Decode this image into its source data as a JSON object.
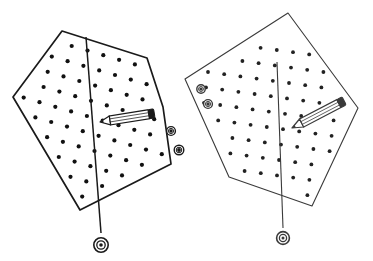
{
  "canvas": {
    "width": 373,
    "height": 261,
    "background": "#ffffff",
    "title": "Two dotted pentagonal panels with pencils and plumb lines"
  },
  "palette": {
    "ink": "#1a1a1a",
    "ink_light": "#444444",
    "dot": "#111111",
    "paper": "#ffffff",
    "pencil_body": "#ffffff",
    "pencil_shade": "#555555"
  },
  "figures": [
    {
      "name": "left-panel",
      "stroke_width": 1.7,
      "stroke": "#1a1a1a",
      "outline": "62,31 147,58 163,107 171,164 80,210 13,97",
      "dot_radius": 2.1,
      "dot_color": "#111111",
      "dot_rows": 10,
      "dot_cols": 8,
      "dot_origin": [
        36,
        52
      ],
      "dot_step_u": [
        15.8,
        4.6
      ],
      "dot_step_v": [
        -4.1,
        15.2
      ],
      "plumb": {
        "top": [
          86,
          37
        ],
        "bottom": [
          101,
          233
        ],
        "bob_center": [
          101,
          245
        ],
        "bob_outer_r": 7.2,
        "bob_mid_r": 4.2,
        "bob_inner_r": 1.8
      },
      "pencil": {
        "tip": [
          100,
          122
        ],
        "tail": [
          150,
          114
        ],
        "width": 9,
        "tip_direction": "left",
        "angle_deg": -9
      },
      "grommets": [
        {
          "cx": 171,
          "cy": 131,
          "r_outer": 4.4,
          "r_inner": 1.7
        },
        {
          "cx": 179,
          "cy": 150,
          "r_outer": 4.8,
          "r_inner": 1.9
        }
      ]
    },
    {
      "name": "right-panel",
      "stroke_width": 1.1,
      "stroke": "#3a3a3a",
      "outline": "288,13 358,108 312,206 229,177 185,79",
      "dot_radius": 1.9,
      "dot_color": "#222222",
      "dot_rows": 9,
      "dot_cols": 8,
      "dot_origin": [
        208,
        72
      ],
      "dot_step_u": [
        16.2,
        2.2
      ],
      "dot_step_v": [
        -2.0,
        15.4
      ],
      "plumb": {
        "top": [
          277,
          62
        ],
        "bottom": [
          283,
          228
        ],
        "bob_center": [
          283,
          238
        ],
        "bob_outer_r": 6.4,
        "bob_mid_r": 3.6,
        "bob_inner_r": 1.5
      },
      "pencil": {
        "tip": [
          292,
          128
        ],
        "tail": [
          340,
          103
        ],
        "width": 9,
        "tip_direction": "left",
        "angle_deg": -27
      },
      "grommets": [
        {
          "cx": 201,
          "cy": 89,
          "r_outer": 4.2,
          "r_inner": 1.6
        },
        {
          "cx": 208,
          "cy": 104,
          "r_outer": 4.4,
          "r_inner": 1.7
        }
      ]
    }
  ]
}
